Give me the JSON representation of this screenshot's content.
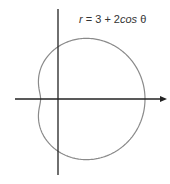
{
  "figure": {
    "equation": {
      "r": "r",
      "rest": " = 3 + 2",
      "cos": "cos",
      "theta": " θ"
    },
    "curve": {
      "a": 3,
      "b": 2,
      "color": "#8a8a8a",
      "stroke_width": 1.2
    },
    "axes": {
      "color": "#222222",
      "origin_px": [
        58,
        99
      ],
      "scale_px_per_unit": 17.4,
      "x_range_px": [
        15,
        167
      ],
      "y_range_px": [
        9,
        175
      ],
      "arrow": "right"
    }
  }
}
